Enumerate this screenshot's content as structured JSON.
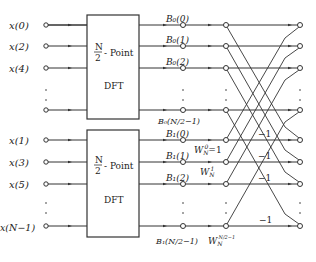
{
  "diagram": {
    "inputs_even": [
      "x(0)",
      "x(2)",
      "x(4)"
    ],
    "inputs_odd": [
      "x(1)",
      "x(3)",
      "x(5)",
      "x(N−1)"
    ],
    "block_top": {
      "frac_num": "N",
      "frac_den": "2",
      "label": "- Point",
      "sub": "DFT"
    },
    "block_bottom": {
      "frac_num": "N",
      "frac_den": "2",
      "label": "- Point",
      "sub": "DFT"
    },
    "outputs_top": [
      "B₀(0)",
      "B₀(1)",
      "B₀(2)",
      "B₀(N/2−1)"
    ],
    "outputs_bottom": [
      "B₁(0)",
      "B₁(1)",
      "B₁(2)",
      "B₁(N/2−1)"
    ],
    "twiddles": [
      "Wₙ⁰=1",
      "Wₙ¹",
      "Wₙ^(N/2−1)"
    ],
    "twiddle_labels": {
      "w0_base": "W",
      "w0_sub": "N",
      "w0_sup": "0",
      "w0_eq": "=1",
      "w1_base": "W",
      "w1_sub": "N",
      "w1_sup": "1",
      "wl_base": "W",
      "wl_sub": "N",
      "wl_sup": "N/2−1"
    },
    "minus_one": "−1",
    "colors": {
      "line": "#333333",
      "bg": "#ffffff"
    }
  }
}
